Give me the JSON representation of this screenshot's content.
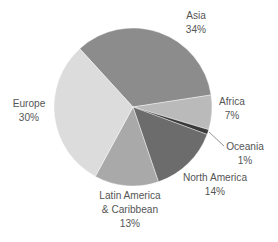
{
  "chart_data": {
    "type": "pie",
    "title": "",
    "center": [
      133,
      107
    ],
    "radius": 79,
    "start_angle_deg": -42.4,
    "slices": [
      {
        "label": "Asia",
        "value": 34,
        "pct": "34%",
        "color": "#8c8c8c"
      },
      {
        "label": "Africa",
        "value": 7,
        "pct": "7%",
        "color": "#bababa"
      },
      {
        "label": "Oceania",
        "value": 1,
        "pct": "1%",
        "color": "#3a3a3a"
      },
      {
        "label": "North America",
        "value": 14,
        "pct": "14%",
        "color": "#6c6c6c"
      },
      {
        "label": "Latin America & Caribbean",
        "value": 13,
        "pct": "13%",
        "color": "#a9a9a9"
      },
      {
        "label": "Europe",
        "value": 30,
        "pct": "30%",
        "color": "#dcdcdc"
      }
    ],
    "legend": "none (direct labels)"
  },
  "labels": {
    "asia": {
      "name": "Asia",
      "pct": "34%"
    },
    "africa": {
      "name": "Africa",
      "pct": "7%"
    },
    "oceania": {
      "name": "Oceania",
      "pct": "1%"
    },
    "north_america": {
      "name": "North America",
      "pct": "14%"
    },
    "latin_america": {
      "line1": "Latin America",
      "line2": "& Caribbean",
      "pct": "13%"
    },
    "europe": {
      "name": "Europe",
      "pct": "30%"
    }
  }
}
